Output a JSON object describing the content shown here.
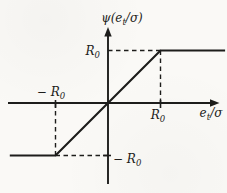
{
  "figure": {
    "background": "#faf9f6",
    "ink": "#1d1d1b",
    "labels": {
      "y_axis": {
        "pre": "ψ(e",
        "sub": "t",
        "post": "/σ)"
      },
      "x_axis": {
        "pre": "e",
        "sub": "t",
        "post": "/σ"
      },
      "y_pos_tick": {
        "pre": "R",
        "sub": "0"
      },
      "y_neg_tick": {
        "pre": "− R",
        "sub": "0"
      },
      "x_pos_tick": {
        "pre": "R",
        "sub": "0"
      },
      "x_neg_tick": {
        "pre": "− R",
        "sub": "0"
      }
    }
  },
  "chart_data": {
    "type": "line",
    "xlabel": "e_t/σ",
    "ylabel": "ψ(e_t/σ)",
    "x_units": "multiples of R0",
    "y_units": "multiples of R0",
    "x": [
      -1.87,
      -1,
      1,
      2.23
    ],
    "y": [
      -1,
      -1,
      1,
      1
    ],
    "saturation_level": "±R0",
    "slope_linear_region": 1,
    "xlim": [
      -1.9,
      2.08
    ],
    "ylim": [
      -1.54,
      1.39
    ],
    "grid": false,
    "legend": false,
    "guides_dashed": [
      [
        0,
        1,
        1,
        1
      ],
      [
        1,
        1,
        1,
        0
      ],
      [
        -1,
        0,
        -1,
        -1
      ],
      [
        -1,
        -1,
        0,
        -1
      ]
    ],
    "ticks": {
      "x": [
        -1,
        1
      ],
      "y": [
        -1
      ]
    }
  }
}
